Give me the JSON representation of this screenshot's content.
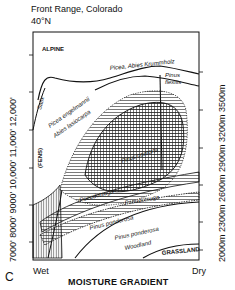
{
  "header": {
    "title": "Front Range, Colorado",
    "latitude": "40°N"
  },
  "panel_letter": "C",
  "axes": {
    "x_label": "MOISTURE GRADIENT",
    "x_left": "Wet",
    "x_right": "Dry",
    "y_left_label": "7000'   8000'   9000'  10,000'  11,000'  12,000'",
    "y_left_ticks": [
      "7000'",
      "8000'",
      "9000'",
      "10,000'",
      "11,000'",
      "12,000'"
    ],
    "y_right_label": "2000m  2300m  2600m  2900m  3200m  3500m",
    "y_right_ticks": [
      "2000m",
      "2300m",
      "2600m",
      "2900m",
      "3200m",
      "3500m"
    ]
  },
  "zones": {
    "alpine": "ALPINE",
    "krummholz": "Picea, Abies Krummholz",
    "salix": "Salix",
    "picea": "Picea engelmannii",
    "abies": "Abies lasiocarpa",
    "fens": "(FENS)",
    "flexilis_1": "Pinus",
    "flexilis_2": "flexilis",
    "contorta": "Pinus contorta",
    "pseudotsuga_1": "Pseudotsuga",
    "pseudotsuga_2": "Pseudotsuga",
    "ponderosa": "Pinus ponderosa",
    "woodland_1": "Pinus ponderosa",
    "woodland_2": "Woodland",
    "grassland": "GRASSLAND",
    "populus": "Populus",
    "picea_pungens": "Picea pungens",
    "pseudotsuga_left": "Pseudotsuga"
  }
}
